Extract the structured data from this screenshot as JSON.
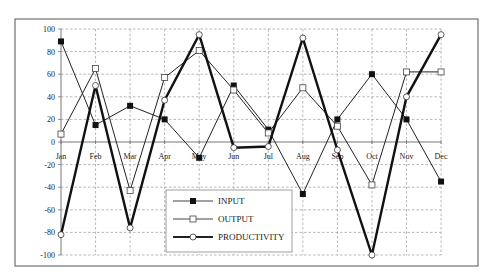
{
  "chart_data": {
    "type": "line",
    "title": "",
    "xlabel": "",
    "ylabel": "",
    "categories": [
      "Jan",
      "Feb",
      "Mar",
      "Apr",
      "May",
      "Jun",
      "Jul",
      "Aug",
      "Sep",
      "Oct",
      "Nov",
      "Dec"
    ],
    "ylim": [
      -100,
      100
    ],
    "yticks": [
      100,
      80,
      60,
      40,
      20,
      0,
      -20,
      -40,
      -60,
      -80,
      -100
    ],
    "grid": true,
    "legend_position": "lower-center-left (inside plot)",
    "series": [
      {
        "name": "INPUT",
        "marker": "filled-square",
        "line_width": 1,
        "color": "#222222",
        "values": [
          89,
          15,
          32,
          20,
          -14,
          50,
          11,
          -46,
          20,
          60,
          20,
          -35
        ]
      },
      {
        "name": "OUTPUT",
        "marker": "open-square",
        "line_width": 1,
        "color": "#222222",
        "values": [
          7,
          65,
          -43,
          57,
          81,
          46,
          8,
          48,
          14,
          -38,
          62,
          62
        ]
      },
      {
        "name": "PRODUCTIVITY",
        "marker": "open-circle",
        "line_width": 2.4,
        "color": "#111111",
        "values": [
          -82,
          50,
          -76,
          37,
          95,
          -5,
          -4,
          92,
          -7,
          -100,
          40,
          95
        ]
      }
    ]
  },
  "legend": {
    "items": [
      {
        "label": "INPUT",
        "marker": "filled-square"
      },
      {
        "label": "OUTPUT",
        "marker": "open-square"
      },
      {
        "label": "PRODUCTIVITY",
        "marker": "open-circle"
      }
    ]
  },
  "colors": {
    "frame": "#555555",
    "grid": "#999999",
    "axis": "#777777",
    "line": "#222222"
  }
}
